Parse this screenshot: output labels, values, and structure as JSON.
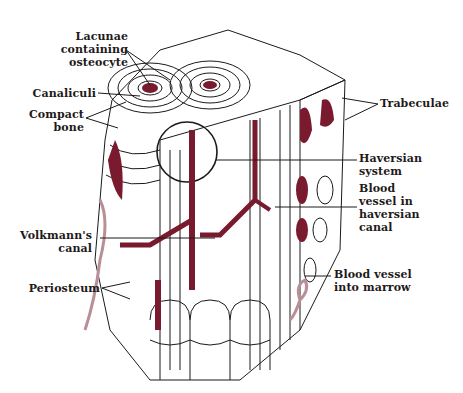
{
  "figure": {
    "colors": {
      "vessel": "#7a1a2e",
      "vessel_light": "#b98f97",
      "line": "#1a1a1a",
      "background": "#ffffff"
    },
    "labels": {
      "lacunae": "Lacunae\ncontaining\nosteocyte",
      "canaliculi": "Canaliculi",
      "compact_bone": "Compact\nbone",
      "trabeculae": "Trabeculae",
      "haversian_system": "Haversian\nsystem",
      "blood_vessel_haversian": "Blood\nvessel in\nhaversian\ncanal",
      "volkmanns_canal": "Volkmann's\ncanal",
      "periosteum": "Periosteum",
      "blood_vessel_marrow": "Blood vessel\ninto marrow"
    }
  }
}
